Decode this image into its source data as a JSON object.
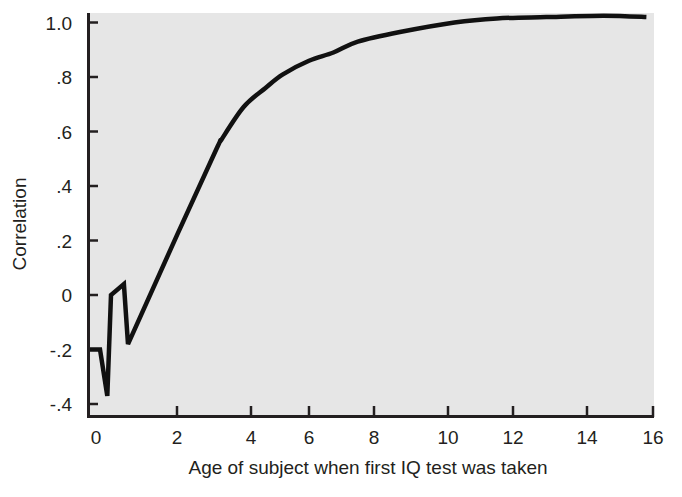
{
  "chart_data": {
    "type": "line",
    "title": "",
    "xlabel": "Age of subject when first IQ test was taken",
    "ylabel": "Correlation",
    "xlim": [
      -0.2,
      16
    ],
    "ylim": [
      -0.4,
      1.05
    ],
    "grid": false,
    "legend": null,
    "x_ticks": [
      {
        "value": 0,
        "label": "0"
      },
      {
        "value": 2,
        "label": "2"
      },
      {
        "value": 4,
        "label": "4"
      },
      {
        "value": 6,
        "label": "6"
      },
      {
        "value": 8,
        "label": "8"
      },
      {
        "value": 10,
        "label": "10"
      },
      {
        "value": 12,
        "label": "12"
      },
      {
        "value": 14,
        "label": "14"
      },
      {
        "value": 16,
        "label": "16"
      }
    ],
    "y_ticks": [
      {
        "value": 1.0,
        "label": "1.0"
      },
      {
        "value": 0.8,
        "label": ".8"
      },
      {
        "value": 0.6,
        "label": ".6"
      },
      {
        "value": 0.4,
        "label": ".4"
      },
      {
        "value": 0.2,
        "label": ".2"
      },
      {
        "value": 0.0,
        "label": "0"
      },
      {
        "value": -0.2,
        "label": "-.2"
      },
      {
        "value": -0.4,
        "label": "-.4"
      }
    ],
    "series": [
      {
        "name": "Correlation with adult IQ",
        "color": "#111111",
        "x": [
          -0.2,
          0.1,
          0.28,
          0.37,
          0.69,
          0.79,
          2.0,
          3.08,
          3.2,
          3.8,
          4.5,
          5.1,
          6.0,
          6.75,
          7.5,
          8.7,
          10.2,
          11.5,
          12.9,
          14.5,
          15.8
        ],
        "y": [
          -0.2,
          -0.2,
          -0.37,
          0.0,
          0.04,
          -0.18,
          0.22,
          0.54,
          0.57,
          0.69,
          0.76,
          0.81,
          0.86,
          0.89,
          0.93,
          0.965,
          1.0,
          1.015,
          1.02,
          1.025,
          1.02
        ]
      }
    ]
  },
  "caption": {
    "partial_text": "Figure: Correlations of IQ scores measured in early childhood with adult IQ (cut off)"
  },
  "colors": {
    "plot_background": "#e6e6e6",
    "axis": "#231f20",
    "line": "#111111"
  }
}
